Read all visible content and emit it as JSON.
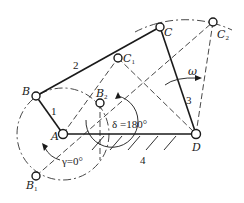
{
  "diagram": {
    "points": {
      "A": {
        "label": "A",
        "x": 63,
        "y": 134
      },
      "B": {
        "label": "B",
        "x": 36,
        "y": 96
      },
      "C": {
        "label": "C",
        "x": 160,
        "y": 27
      },
      "D": {
        "label": "D",
        "x": 196,
        "y": 134
      },
      "B1": {
        "label": "B",
        "sub": "1",
        "x": 36,
        "y": 176
      },
      "B2": {
        "label": "B",
        "sub": "2",
        "x": 100,
        "y": 103
      },
      "C1": {
        "label": "C",
        "sub": "1",
        "x": 118,
        "y": 58
      },
      "C2": {
        "label": "C",
        "sub": "2",
        "x": 213,
        "y": 22
      }
    },
    "links": [
      {
        "id": "1",
        "label": "1",
        "from": "A",
        "to": "B"
      },
      {
        "id": "2",
        "label": "2",
        "from": "B",
        "to": "C"
      },
      {
        "id": "3",
        "label": "3",
        "from": "C",
        "to": "D"
      },
      {
        "id": "4",
        "label": "4",
        "from": "A",
        "to": "D",
        "type": "ground"
      }
    ],
    "annotations": {
      "omega": "ω",
      "delta": "δ =180°",
      "gamma": "γ=0°"
    },
    "colors": {
      "line": "#1a1a1a",
      "background": "#ffffff"
    }
  }
}
